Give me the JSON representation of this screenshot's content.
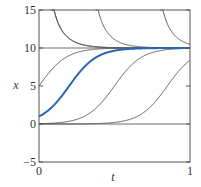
{
  "chart_data": {
    "type": "line",
    "title": "",
    "xlabel": "t",
    "ylabel": "x",
    "xlim": [
      0,
      1
    ],
    "ylim": [
      -5,
      15
    ],
    "xticks": [
      0,
      1
    ],
    "yticks": [
      -5,
      0,
      5,
      10,
      15
    ],
    "xtick_labels": [
      "0",
      "1"
    ],
    "ytick_labels": [
      "−5",
      "0",
      "5",
      "10",
      "15"
    ],
    "grid": false,
    "legend": null,
    "model": "logistic: dx/dt = r x (1 - x/K)",
    "params": {
      "r": 11,
      "K": 10
    },
    "series": [
      {
        "name": "equilibrium x=10",
        "x0": 10,
        "color": "#555555",
        "highlight": false
      },
      {
        "name": "equilibrium x=0",
        "x0": 0,
        "color": "#555555",
        "highlight": false
      },
      {
        "name": "x0=1",
        "x0": 1,
        "color": "#2a66b8",
        "highlight": true
      },
      {
        "name": "x0=5",
        "x0": 5,
        "color": "#555555",
        "highlight": false
      },
      {
        "name": "x0=0.041",
        "x0": 0.041,
        "color": "#555555",
        "highlight": false
      },
      {
        "name": "x0=0.00087",
        "x0": 0.00087,
        "color": "#555555",
        "highlight": false
      },
      {
        "name": "above K, enters x=15 at t≈0.16",
        "x0": 1800,
        "color": "#555555",
        "highlight": false
      },
      {
        "name": "above K, enters x=15 at t≈0.58",
        "x0": 190000.0,
        "color": "#555555",
        "highlight": false
      },
      {
        "name": "below 0, exits x=-5 at t≈0.25",
        "x0": -0.42,
        "color": "#555555",
        "highlight": false
      },
      {
        "name": "below 0, exits x=-5 at t≈0.69",
        "x0": -0.0036,
        "color": "#555555",
        "highlight": false
      }
    ],
    "sample_points": {
      "x0=1": [
        [
          0,
          1.0
        ],
        [
          0.1,
          2.3
        ],
        [
          0.2,
          4.75
        ],
        [
          0.3,
          7.3
        ],
        [
          0.4,
          9.1
        ],
        [
          0.5,
          9.74
        ],
        [
          1.0,
          10.0
        ]
      ],
      "x0=5": [
        [
          0,
          5.0
        ],
        [
          0.1,
          7.5
        ],
        [
          0.2,
          9.0
        ],
        [
          0.35,
          9.79
        ],
        [
          1.0,
          10.0
        ]
      ],
      "x0=0.041": [
        [
          0,
          0.04
        ],
        [
          0.3,
          1.0
        ],
        [
          0.5,
          5.0
        ],
        [
          0.7,
          9.0
        ],
        [
          1.0,
          9.96
        ]
      ],
      "x0=0.00087": [
        [
          0,
          0.0
        ],
        [
          0.6,
          0.65
        ],
        [
          0.85,
          5.0
        ],
        [
          1.0,
          8.3
        ]
      ]
    }
  }
}
